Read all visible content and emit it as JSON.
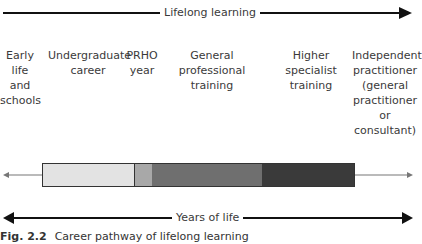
{
  "top_arrow": {
    "label": "Lifelong learning"
  },
  "bottom_arrow": {
    "label": "Years of life"
  },
  "stages": [
    {
      "label": "Early\nlife\nand\nschools"
    },
    {
      "label": "Undergraduate\ncareer"
    },
    {
      "label": "PRHO\nyear"
    },
    {
      "label": "General\nprofessional\ntraining"
    },
    {
      "label": "Higher\nspecialist\ntraining"
    },
    {
      "label": "Independent\npractitioner\n(general\npractitioner\nor\nconsultant)"
    }
  ],
  "bar_segments": [
    {
      "name": "undergraduate",
      "color": "#e3e3e3"
    },
    {
      "name": "prho",
      "color": "#a8a8a8"
    },
    {
      "name": "general-professional",
      "color": "#6f6f6f"
    },
    {
      "name": "higher-specialist",
      "color": "#3a3a3a"
    }
  ],
  "caption": {
    "fig": "Fig. 2.2",
    "text": "Career pathway of lifelong learning"
  }
}
